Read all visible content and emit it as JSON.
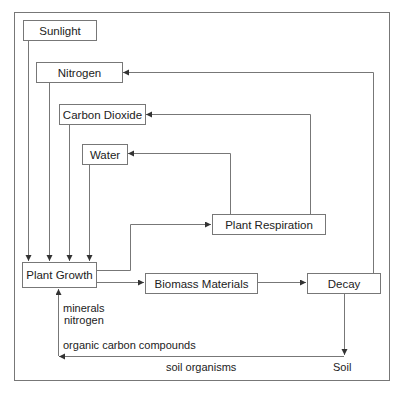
{
  "diagram": {
    "nodes": {
      "sunlight": "Sunlight",
      "nitrogen": "Nitrogen",
      "carbon_dioxide": "Carbon Dioxide",
      "water": "Water",
      "plant_growth": "Plant Growth",
      "plant_respiration": "Plant Respiration",
      "biomass": "Biomass Materials",
      "decay": "Decay",
      "soil": "Soil"
    },
    "labels": {
      "minerals": "minerals",
      "nitrogen": "nitrogen",
      "organic_carbon": "organic carbon compounds",
      "soil_organisms": "soil organisms"
    },
    "edges": [
      {
        "from": "Sunlight",
        "to": "Plant Growth"
      },
      {
        "from": "Nitrogen",
        "to": "Plant Growth"
      },
      {
        "from": "Carbon Dioxide",
        "to": "Plant Growth"
      },
      {
        "from": "Water",
        "to": "Plant Growth"
      },
      {
        "from": "Plant Growth",
        "to": "Plant Respiration"
      },
      {
        "from": "Plant Growth",
        "to": "Biomass Materials"
      },
      {
        "from": "Biomass Materials",
        "to": "Decay"
      },
      {
        "from": "Plant Respiration",
        "to": "Water"
      },
      {
        "from": "Plant Respiration",
        "to": "Carbon Dioxide"
      },
      {
        "from": "Decay",
        "to": "Nitrogen"
      },
      {
        "from": "Decay",
        "to": "Soil"
      },
      {
        "from": "Soil",
        "to": "Plant Growth",
        "label": "minerals, nitrogen, organic carbon compounds, soil organisms"
      }
    ],
    "colors": {
      "line": "#666666",
      "text": "#222222",
      "border": "#777777"
    }
  }
}
